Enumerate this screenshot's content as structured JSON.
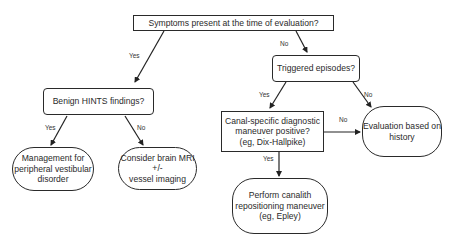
{
  "diagram": {
    "type": "flowchart",
    "nodes": {
      "symptoms": {
        "text": "Symptoms present at the time of evaluation?",
        "shape": "rectangle"
      },
      "hints": {
        "text": "Benign HINTS findings?",
        "shape": "rounded-rectangle"
      },
      "triggered": {
        "text": "Triggered episodes?",
        "shape": "rounded-rectangle"
      },
      "management": {
        "lines": [
          "Management for",
          "peripheral vestibular",
          "disorder"
        ],
        "shape": "terminal"
      },
      "mri": {
        "lines": [
          "Consider brain MRI",
          "+/-",
          "vessel imaging"
        ],
        "shape": "terminal"
      },
      "canal": {
        "lines": [
          "Canal-specific diagnostic",
          "maneuver positive?",
          "(eg, Dix-Hallpike)"
        ],
        "shape": "rectangle"
      },
      "history": {
        "lines": [
          "Evaluation based on",
          "history"
        ],
        "shape": "terminal"
      },
      "epley": {
        "lines": [
          "Perform canalith",
          "repositioning maneuver",
          "(eg, Epley)"
        ],
        "shape": "terminal"
      }
    },
    "edges": [
      {
        "from": "symptoms",
        "to": "hints",
        "label": "Yes"
      },
      {
        "from": "symptoms",
        "to": "triggered",
        "label": "No"
      },
      {
        "from": "hints",
        "to": "management",
        "label": "Yes"
      },
      {
        "from": "hints",
        "to": "mri",
        "label": "No"
      },
      {
        "from": "triggered",
        "to": "canal",
        "label": "Yes"
      },
      {
        "from": "triggered",
        "to": "history",
        "label": "No"
      },
      {
        "from": "canal",
        "to": "history",
        "label": "No"
      },
      {
        "from": "canal",
        "to": "epley",
        "label": "Yes"
      }
    ]
  }
}
